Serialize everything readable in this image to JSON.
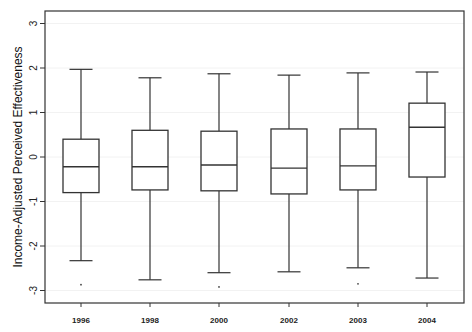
{
  "chart_data": {
    "type": "box",
    "title": "",
    "xlabel": "",
    "ylabel": "Income-Adjusted Perceived Effectiveness",
    "ylim": [
      -3.3,
      3.3
    ],
    "yticks": [
      3,
      2,
      1,
      0,
      -1,
      -2,
      -3
    ],
    "ytick_labels": [
      "3",
      "2",
      "1",
      "0",
      "-1",
      "-2",
      "-3"
    ],
    "grid": false,
    "legend": null,
    "categories": [
      "1996",
      "1998",
      "2000",
      "2002",
      "2003",
      "2004"
    ],
    "series": [
      {
        "name": "1996",
        "whisker_high": 1.97,
        "q3": 0.4,
        "median": -0.22,
        "q1": -0.8,
        "whisker_low": -2.33,
        "outliers": [
          -2.87
        ]
      },
      {
        "name": "1998",
        "whisker_high": 1.78,
        "q3": 0.6,
        "median": -0.22,
        "q1": -0.74,
        "whisker_low": -2.76,
        "outliers": []
      },
      {
        "name": "2000",
        "whisker_high": 1.87,
        "q3": 0.58,
        "median": -0.18,
        "q1": -0.76,
        "whisker_low": -2.6,
        "outliers": [
          -2.92
        ]
      },
      {
        "name": "2002",
        "whisker_high": 1.84,
        "q3": 0.63,
        "median": -0.25,
        "q1": -0.83,
        "whisker_low": -2.58,
        "outliers": []
      },
      {
        "name": "2003",
        "whisker_high": 1.89,
        "q3": 0.63,
        "median": -0.2,
        "q1": -0.74,
        "whisker_low": -2.49,
        "outliers": [
          -2.85
        ]
      },
      {
        "name": "2004",
        "whisker_high": 1.91,
        "q3": 1.21,
        "median": 0.67,
        "q1": -0.45,
        "whisker_low": -2.72,
        "outliers": []
      }
    ]
  },
  "style": {
    "line_color": "#333333",
    "background": "#ffffff"
  }
}
